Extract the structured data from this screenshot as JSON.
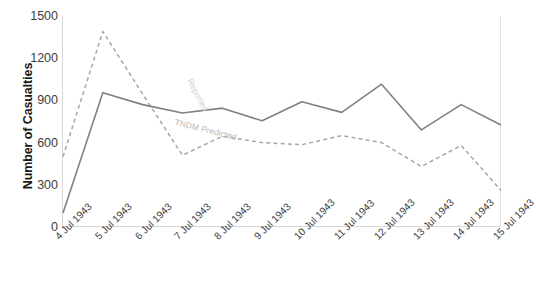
{
  "chart_data": {
    "type": "line",
    "title": "",
    "xlabel": "",
    "ylabel": "Number of Casualties",
    "ylim": [
      0,
      1500
    ],
    "yticks": [
      0,
      300,
      600,
      900,
      1200,
      1500
    ],
    "grid": false,
    "legend": "inline-annotations",
    "categories": [
      "4 Jul 1943",
      "5 Jul 1943",
      "6 Jul 1943",
      "7 Jul 1943",
      "8 Jul 1943",
      "9 Jul 1943",
      "10 Jul 1943",
      "11 Jul 1943",
      "12 Jul 1943",
      "13 Jul 1943",
      "14 Jul 1943",
      "15 Jul 1943"
    ],
    "series": [
      {
        "name": "TNDM Predicted",
        "style": "solid",
        "color": "#808080",
        "values": [
          100,
          955,
          870,
          810,
          845,
          755,
          890,
          815,
          1015,
          690,
          870,
          725
        ]
      },
      {
        "name": "Reported",
        "style": "dashed",
        "color": "#a6a6a6",
        "values": [
          500,
          1390,
          945,
          510,
          645,
          600,
          585,
          650,
          600,
          430,
          580,
          260
        ]
      }
    ],
    "annotations": [
      {
        "text": "Reported",
        "series": "Reported"
      },
      {
        "text": "TNDM Predicted",
        "series": "TNDM Predicted"
      }
    ]
  },
  "colors": {
    "solid_series": "#808080",
    "dashed_series": "#a6a6a6",
    "axis": "#d6d6d6",
    "tick_text": "#3d3d3d",
    "title_text": "#1a1a1a",
    "background": "#ffffff"
  }
}
